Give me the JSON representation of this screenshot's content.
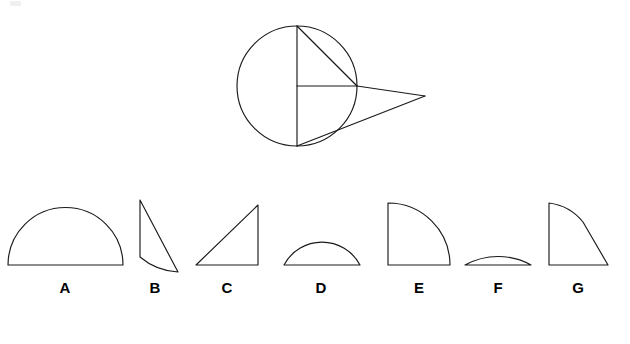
{
  "figure": {
    "background_color": "#ffffff",
    "stroke_color": "#1a1a1a",
    "label_color": "#000000",
    "top_diagram": {
      "name": "circle-tangent-diagram",
      "circle": {
        "cx": 297,
        "cy": 86,
        "r": 60
      },
      "points": {
        "top": {
          "x": 297,
          "y": 26
        },
        "bottom": {
          "x": 297,
          "y": 146
        },
        "center": {
          "x": 297,
          "y": 86
        },
        "right_on_circle": {
          "x": 357,
          "y": 86
        },
        "apex": {
          "x": 425,
          "y": 96
        }
      },
      "segments": [
        {
          "name": "vertical-diameter",
          "from": "top",
          "to": "bottom"
        },
        {
          "name": "horizontal-radius",
          "from": "center",
          "to": "right_on_circle"
        },
        {
          "name": "chord-top-to-right",
          "from": "top",
          "to": "right_on_circle"
        },
        {
          "name": "horizontal-extension-to-apex",
          "from": "right_on_circle",
          "to": "apex"
        },
        {
          "name": "line-bottom-to-apex",
          "from": "bottom",
          "to": "apex"
        }
      ]
    },
    "shapes": [
      {
        "id": "A",
        "label": "A",
        "name": "semicircle",
        "description": "semicircle with flat horizontal base and full domed arc",
        "bbox": {
          "x": 8,
          "y": 207,
          "width": 115,
          "height": 58
        },
        "label_x": 65,
        "label_y": 293
      },
      {
        "id": "B",
        "label": "B",
        "name": "thin-sliver",
        "description": "narrow tall sliver: vertical left edge, straight diagonal right edge, concave curved bottom",
        "bbox": {
          "x": 138,
          "y": 200,
          "width": 40,
          "height": 72
        },
        "label_x": 155,
        "label_y": 293
      },
      {
        "id": "C",
        "label": "C",
        "name": "right-triangle",
        "description": "right triangle, right angle at bottom-right, hypotenuse from bottom-left to top-right",
        "bbox": {
          "x": 196,
          "y": 205,
          "width": 62,
          "height": 60
        },
        "label_x": 227,
        "label_y": 293
      },
      {
        "id": "D",
        "label": "D",
        "name": "shallow-circular-segment",
        "description": "shallow circular segment, flat chord base with a low arc above",
        "bbox": {
          "x": 284,
          "y": 243,
          "width": 76,
          "height": 22
        },
        "label_x": 321,
        "label_y": 293
      },
      {
        "id": "E",
        "label": "E",
        "name": "quarter-circle",
        "description": "quarter circle sector, right angle at bottom-left, arc from top-left to bottom-right",
        "bbox": {
          "x": 388,
          "y": 203,
          "width": 62,
          "height": 62
        },
        "label_x": 419,
        "label_y": 293
      },
      {
        "id": "F",
        "label": "F",
        "name": "very-thin-circular-segment",
        "description": "very thin flat circular segment, flatter than D",
        "bbox": {
          "x": 465,
          "y": 253,
          "width": 66,
          "height": 12
        },
        "label_x": 498,
        "label_y": 293
      },
      {
        "id": "G",
        "label": "G",
        "name": "sector-with-straight-edge",
        "description": "quadrant-like region: vertical left edge, horizontal bottom edge, curved top-left transitioning to a straight diagonal at lower right",
        "bbox": {
          "x": 548,
          "y": 203,
          "width": 60,
          "height": 62
        },
        "label_x": 578,
        "label_y": 293
      }
    ]
  }
}
